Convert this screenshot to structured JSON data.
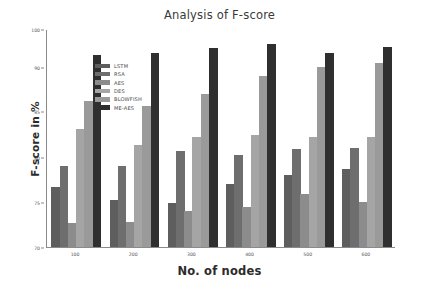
{
  "chart_data": {
    "type": "bar",
    "title": "Analysis of F-score",
    "xlabel": "No. of nodes",
    "ylabel": "F-score in %",
    "categories": [
      "100",
      "200",
      "300",
      "400",
      "500",
      "600"
    ],
    "ylim": [
      70,
      100
    ],
    "yticks": [
      70,
      75,
      80,
      85,
      90,
      100
    ],
    "ytick_labels": [
      "70",
      "75",
      "80",
      "85",
      "90",
      "100"
    ],
    "grid": false,
    "legend_position": "upper-left",
    "series": [
      {
        "name": "LSTM",
        "color": "#5e5e5e",
        "values": [
          76.6,
          75.2,
          74.8,
          77.0,
          78.0,
          78.6
        ]
      },
      {
        "name": "RSA",
        "color": "#6e6e6e",
        "values": [
          79.0,
          78.9,
          80.6,
          80.2,
          80.8,
          81.0
        ]
      },
      {
        "name": "AES",
        "color": "#8c8c8c",
        "values": [
          72.6,
          72.8,
          74.0,
          74.4,
          75.8,
          75.0
        ]
      },
      {
        "name": "DES",
        "color": "#a5a5a5",
        "values": [
          83.0,
          81.3,
          82.2,
          82.4,
          82.2,
          82.2
        ]
      },
      {
        "name": "BLOWFISH",
        "color": "#9a9a9a",
        "values": [
          86.2,
          85.6,
          87.0,
          89.0,
          90.0,
          91.2
        ]
      },
      {
        "name": "ME-AES",
        "color": "#2f2f2f",
        "values": [
          93.2,
          93.8,
          95.0,
          96.2,
          93.8,
          95.4
        ]
      }
    ]
  },
  "axis_colors": {
    "axis_line": "#8a8a8a",
    "tick_text": "#555555",
    "title_text": "#3a3a3a",
    "label_text": "#2b2b2b",
    "background": "#ffffff"
  }
}
